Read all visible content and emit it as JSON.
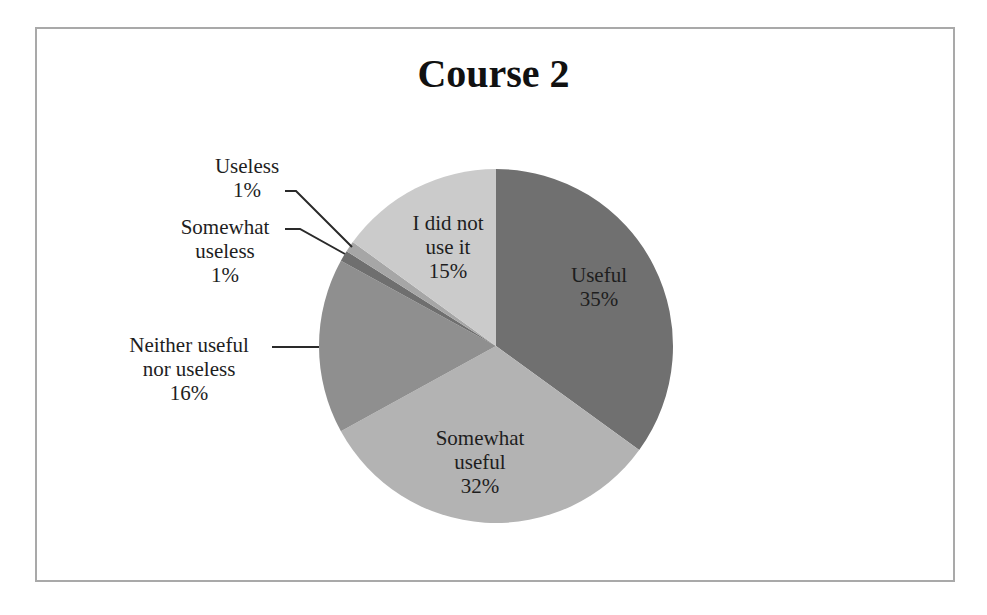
{
  "chart_data": {
    "type": "pie",
    "title": "Course 2",
    "categories": [
      "Useful",
      "Somewhat useful",
      "Neither useful nor useless",
      "Somewhat useless",
      "Useless",
      "I did not use it"
    ],
    "values": [
      35,
      32,
      16,
      1,
      1,
      15
    ],
    "unit": "%",
    "start_angle": "12 o'clock",
    "direction": "clockwise",
    "colors": [
      "#707070",
      "#b3b3b3",
      "#8f8f8f",
      "#6f6f6f",
      "#a6a6a6",
      "#cbcbcb"
    ],
    "legend": "none (data labels with category name and percentage)",
    "labels": [
      {
        "lines": [
          "Useful",
          "35%"
        ],
        "position": "inside"
      },
      {
        "lines": [
          "Somewhat",
          "useful",
          "32%"
        ],
        "position": "inside"
      },
      {
        "lines": [
          "Neither useful",
          "nor useless",
          "16%"
        ],
        "position": "outside-left",
        "leader_line": true
      },
      {
        "lines": [
          "Somewhat",
          "useless",
          "1%"
        ],
        "position": "outside-left",
        "leader_line": true
      },
      {
        "lines": [
          "Useless",
          "1%"
        ],
        "position": "outside-top-left",
        "leader_line": true
      },
      {
        "lines": [
          "I did not",
          "use it",
          "15%"
        ],
        "position": "inside"
      }
    ]
  },
  "colors": {
    "frame_border": "#a9a9a9",
    "leader_line": "#2a2a2a"
  }
}
